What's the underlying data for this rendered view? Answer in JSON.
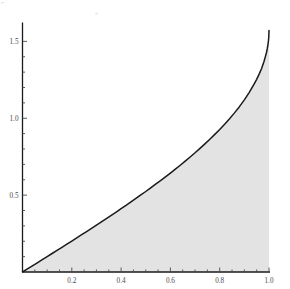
{
  "chart_data": {
    "type": "area",
    "title": "",
    "subtitle": "",
    "xlabel": "",
    "ylabel": "",
    "function": "arcsin(x)",
    "grid": false,
    "legend": null,
    "fill_color": "#e3e3e3",
    "line_color": "#1a1a1a",
    "axis_color": "#1a1a1a",
    "tick_color": "#4a4a4a",
    "xlim": [
      0.0,
      1.0
    ],
    "ylim": [
      0.0,
      1.5708
    ],
    "x_ticks": [
      0.2,
      0.4,
      0.6,
      0.8,
      1.0
    ],
    "x_tick_labels": [
      "0.2",
      "0.4",
      "0.6",
      "0.8",
      "1.0"
    ],
    "x_minor_ticks": [
      0.05,
      0.1,
      0.15,
      0.25,
      0.3,
      0.35,
      0.45,
      0.5,
      0.55,
      0.65,
      0.7,
      0.75,
      0.85,
      0.9,
      0.95
    ],
    "y_ticks": [
      0.5,
      1.0,
      1.5
    ],
    "y_tick_labels": [
      "0.5",
      "1.0",
      "1.5"
    ],
    "y_minor_ticks": [
      0.1,
      0.2,
      0.3,
      0.4,
      0.6,
      0.7,
      0.8,
      0.9,
      1.1,
      1.2,
      1.3,
      1.4
    ],
    "x": [
      0.0,
      0.02,
      0.04,
      0.06,
      0.08,
      0.1,
      0.12,
      0.14,
      0.16,
      0.18,
      0.2,
      0.22,
      0.24,
      0.26,
      0.28,
      0.3,
      0.32,
      0.34,
      0.36,
      0.38,
      0.4,
      0.42,
      0.44,
      0.46,
      0.48,
      0.5,
      0.52,
      0.54,
      0.56,
      0.58,
      0.6,
      0.62,
      0.64,
      0.66,
      0.68,
      0.7,
      0.72,
      0.74,
      0.76,
      0.78,
      0.8,
      0.82,
      0.84,
      0.86,
      0.88,
      0.9,
      0.92,
      0.94,
      0.95,
      0.96,
      0.97,
      0.98,
      0.985,
      0.99,
      0.993,
      0.996,
      0.998,
      0.999,
      1.0
    ],
    "y": [
      0.0,
      0.02,
      0.04001,
      0.06004,
      0.08009,
      0.10017,
      0.12029,
      0.14046,
      0.16069,
      0.18099,
      0.20136,
      0.22181,
      0.24236,
      0.263,
      0.28376,
      0.30469,
      0.32563,
      0.34681,
      0.36817,
      0.38972,
      0.41152,
      0.43355,
      0.45586,
      0.47846,
      0.5014,
      0.5236,
      0.54742,
      0.5716,
      0.59432,
      0.61884,
      0.6435,
      0.66874,
      0.69455,
      0.72099,
      0.74813,
      0.7754,
      0.80406,
      0.83348,
      0.8638,
      0.89517,
      0.9273,
      0.96118,
      0.99695,
      1.03488,
      1.07535,
      1.11977,
      1.16835,
      1.2244,
      1.25323,
      1.287,
      1.32398,
      1.37046,
      1.399,
      1.42926,
      1.45258,
      1.48128,
      1.50746,
      1.52607,
      1.5708
    ],
    "note": "Area under the inverse sine curve from x=0 to x=1; curve terminates at y = pi/2 = 1.5708 with a vertical asymptotic slope."
  },
  "axes": {
    "x_axis_name": "x-axis",
    "y_axis_name": "y-axis"
  },
  "artifacts": {
    "corner_mark": "⌐"
  }
}
